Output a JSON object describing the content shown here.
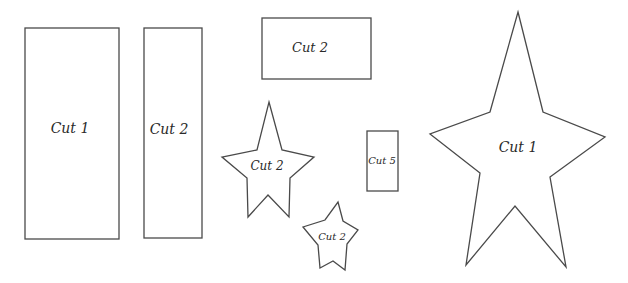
{
  "pattern": {
    "stroke_color": "#4a4a4a",
    "background": "#ffffff",
    "pieces": [
      {
        "id": "tall-rect",
        "shape": "rectangle",
        "label": "Cut 1"
      },
      {
        "id": "narrow-rect",
        "shape": "rectangle",
        "label": "Cut 2"
      },
      {
        "id": "wide-rect",
        "shape": "rectangle",
        "label": "Cut 2"
      },
      {
        "id": "medium-star",
        "shape": "star",
        "label": "Cut 2"
      },
      {
        "id": "small-rect",
        "shape": "rectangle",
        "label": "Cut 5"
      },
      {
        "id": "small-star",
        "shape": "star",
        "label": "Cut 2"
      },
      {
        "id": "large-star",
        "shape": "star",
        "label": "Cut 1"
      }
    ]
  }
}
